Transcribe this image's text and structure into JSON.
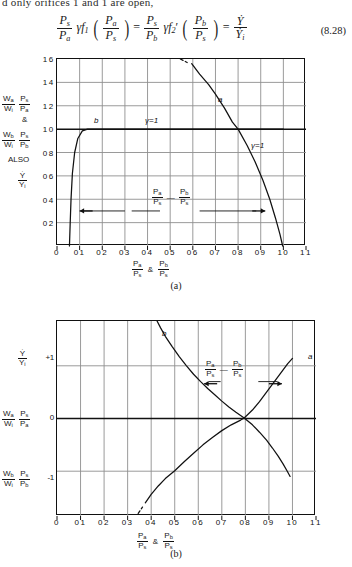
{
  "page": {
    "cut_text_line": "d only orifices 1 and 1 are open,",
    "equation_number": "(8.28)",
    "equation": {
      "lhs_frac_num": "P",
      "lhs_frac_num_sub": "s",
      "lhs_frac_den": "P",
      "lhs_frac_den_sub": "a",
      "gamma": "γ",
      "f1": "f",
      "f1_sub": "1",
      "arg1_num": "P",
      "arg1_num_sub": "a",
      "arg1_den": "P",
      "arg1_den_sub": "s",
      "eq1": "=",
      "mid_frac_num": "P",
      "mid_frac_num_sub": "s",
      "mid_frac_den": "P",
      "mid_frac_den_sub": "b",
      "f2": "f",
      "f2_sub": "2",
      "f2_prime": "′",
      "arg2_num": "P",
      "arg2_num_sub": "b",
      "arg2_den": "P",
      "arg2_den_sub": "s",
      "eq2": "=",
      "rhs_num": "Ẏ",
      "rhs_den": "Ẏ",
      "rhs_den_sub": "i"
    }
  },
  "chart_a": {
    "caption": "(a)",
    "x_axis_title_parts": {
      "left_num": "P",
      "left_num_sub": "a",
      "left_den": "P",
      "left_den_sub": "s",
      "amp": "&",
      "right_num": "P",
      "right_num_sub": "b",
      "right_den": "P",
      "right_den_sub": "s"
    },
    "y_side_labels": [
      {
        "id": "wa",
        "num": "W",
        "num_sub": "a",
        "den": "W",
        "den_sub": "i",
        "f2num": "P",
        "f2num_sub": "s",
        "f2den": "P",
        "f2den_sub": "a"
      },
      {
        "id": "amp",
        "text": "&"
      },
      {
        "id": "wb",
        "num": "W",
        "num_sub": "b",
        "den": "W",
        "den_sub": "i",
        "f2num": "P",
        "f2num_sub": "s",
        "f2den": "P",
        "f2den_sub": "b"
      },
      {
        "id": "also",
        "text": "ALSO"
      },
      {
        "id": "ydot",
        "num": "Ẏ",
        "den": "Ẏ",
        "den_sub": "i"
      }
    ],
    "inner_annotation": {
      "left_num": "P",
      "left_num_sub": "a",
      "left_den": "P",
      "left_den_sub": "s",
      "dash": "—",
      "right_num": "P",
      "right_num_sub": "b",
      "right_den": "P",
      "right_den_sub": "s"
    },
    "curve_labels": [
      {
        "text": "b",
        "x": 0.17,
        "y": 1.08
      },
      {
        "text": "a",
        "x": 0.67,
        "y": 1.4
      },
      {
        "text": "γ=1",
        "x": 0.36,
        "y": 1.08
      },
      {
        "text": "γ=1",
        "x": 0.755,
        "y": 0.92
      }
    ],
    "chart_data": {
      "type": "line",
      "title": "",
      "xlabel": "Pa/Ps & Pb/Ps",
      "ylabel": "Wa/Wi·Ps/Pa & Wb/Wi·Ps/Pb  ALSO  Ẏ/Ẏi",
      "xlim": [
        0,
        1.1
      ],
      "ylim": [
        0,
        1.6
      ],
      "xticks": [
        0,
        0.1,
        0.2,
        0.3,
        0.4,
        0.5,
        0.6,
        0.7,
        0.8,
        0.9,
        1.0,
        1.1
      ],
      "xticklabels": [
        "0",
        "0 1",
        "0 2",
        "0 3",
        "0 4",
        "0 5",
        "0 6",
        "0 7",
        "0 8",
        "0 9",
        "1 0",
        "1 1"
      ],
      "yticks": [
        0.2,
        0.4,
        0.6,
        0.8,
        1.0,
        1.2,
        1.4,
        1.6
      ],
      "yticklabels": [
        "0 2",
        "0 4",
        "0 6",
        "0 8",
        "1 0",
        "1 2",
        "1 4",
        "1 6"
      ],
      "grid": true,
      "legend": "none",
      "series": [
        {
          "name": "b",
          "style": "solid",
          "points": [
            [
              0.055,
              0.0
            ],
            [
              0.058,
              0.18
            ],
            [
              0.062,
              0.4
            ],
            [
              0.068,
              0.62
            ],
            [
              0.078,
              0.8
            ],
            [
              0.092,
              0.92
            ],
            [
              0.112,
              0.985
            ],
            [
              0.135,
              1.0
            ],
            [
              0.2,
              1.0
            ],
            [
              0.4,
              1.0
            ],
            [
              0.6,
              1.0
            ],
            [
              0.8,
              1.0
            ],
            [
              0.95,
              1.0
            ],
            [
              1.0,
              1.0
            ]
          ]
        },
        {
          "name": "a",
          "style": "solid",
          "points": [
            [
              0.595,
              1.56
            ],
            [
              0.63,
              1.47
            ],
            [
              0.67,
              1.38
            ],
            [
              0.7,
              1.3
            ],
            [
              0.74,
              1.18
            ],
            [
              0.775,
              1.06
            ],
            [
              0.8,
              1.0
            ],
            [
              0.84,
              0.86
            ],
            [
              0.875,
              0.72
            ],
            [
              0.91,
              0.56
            ],
            [
              0.94,
              0.4
            ],
            [
              0.965,
              0.24
            ],
            [
              0.985,
              0.1
            ],
            [
              0.997,
              0.0
            ]
          ]
        },
        {
          "name": "a-dashed-extension",
          "style": "dashed",
          "points": [
            [
              0.545,
              1.6
            ],
            [
              0.575,
              1.57
            ]
          ]
        }
      ],
      "annotations": [
        {
          "text": "Pa/Ps — Pb/Ps",
          "x": 0.5,
          "y": 0.3
        },
        {
          "text": "arrow-left",
          "x": 0.1,
          "y": 0.3
        },
        {
          "text": "arrow-right",
          "x": 0.92,
          "y": 0.3
        }
      ]
    }
  },
  "chart_b": {
    "caption": "(b)",
    "x_axis_title_parts": {
      "left_num": "P",
      "left_num_sub": "a",
      "left_den": "P",
      "left_den_sub": "s",
      "amp": "&",
      "right_num": "P",
      "right_num_sub": "b",
      "right_den": "P",
      "right_den_sub": "s"
    },
    "y_side_labels": [
      {
        "id": "ydot",
        "num": "Ẏ",
        "den": "Ẏ",
        "den_sub": "i",
        "tick": "+1"
      },
      {
        "id": "wa",
        "num": "W",
        "num_sub": "a",
        "den": "W",
        "den_sub": "i",
        "f2num": "P",
        "f2num_sub": "s",
        "f2den": "P",
        "f2den_sub": "a",
        "tick": "0"
      },
      {
        "id": "wb",
        "num": "W",
        "num_sub": "b",
        "den": "W",
        "den_sub": "i",
        "f2num": "P",
        "f2num_sub": "s",
        "f2den": "P",
        "f2den_sub": "b",
        "tick": "-1"
      }
    ],
    "inner_annotation": {
      "left_num": "P",
      "left_num_sub": "a",
      "left_den": "P",
      "left_den_sub": "s",
      "dash": "—",
      "right_num": "P",
      "right_num_sub": "b",
      "right_den": "P",
      "right_den_sub": "s"
    },
    "curve_labels": [
      {
        "text": "b",
        "x": 0.465,
        "y": 1.55
      },
      {
        "text": "a",
        "x": 1.005,
        "y": 1.1
      }
    ],
    "chart_data": {
      "type": "line",
      "title": "",
      "xlabel": "Pa/Ps & Pb/Ps",
      "ylabel": "Ẏ/Ẏi , Wa/Wi·Ps/Pa , Wb/Wi·Ps/Pb",
      "xlim": [
        0,
        1.1
      ],
      "ylim": [
        -1.85,
        1.85
      ],
      "xticks": [
        0,
        0.1,
        0.2,
        0.3,
        0.4,
        0.5,
        0.6,
        0.7,
        0.8,
        0.9,
        1.0,
        1.1
      ],
      "xticklabels": [
        "0",
        "0 1",
        "0 2",
        "0 3",
        "0 4",
        "0 5",
        "0 6",
        "0 7",
        "0 8",
        "0 9",
        "1 0",
        "1 1"
      ],
      "yticks": [
        1,
        0,
        -1
      ],
      "yticklabels": [
        "+1",
        "0",
        "-1"
      ],
      "grid": true,
      "legend": "none",
      "series": [
        {
          "name": "b",
          "style": "solid",
          "points": [
            [
              0.425,
              1.85
            ],
            [
              0.44,
              1.72
            ],
            [
              0.46,
              1.56
            ],
            [
              0.49,
              1.36
            ],
            [
              0.52,
              1.17
            ],
            [
              0.55,
              1.0
            ],
            [
              0.58,
              0.84
            ],
            [
              0.61,
              0.7
            ],
            [
              0.64,
              0.57
            ],
            [
              0.67,
              0.45
            ],
            [
              0.7,
              0.33
            ],
            [
              0.73,
              0.22
            ],
            [
              0.76,
              0.12
            ],
            [
              0.795,
              0.01
            ],
            [
              0.83,
              -0.12
            ],
            [
              0.86,
              -0.26
            ],
            [
              0.89,
              -0.41
            ],
            [
              0.915,
              -0.56
            ],
            [
              0.94,
              -0.72
            ],
            [
              0.96,
              -0.86
            ],
            [
              0.978,
              -1.0
            ],
            [
              0.99,
              -1.1
            ]
          ]
        },
        {
          "name": "a",
          "style": "solid",
          "points": [
            [
              0.375,
              -1.6
            ],
            [
              0.4,
              -1.44
            ],
            [
              0.43,
              -1.28
            ],
            [
              0.46,
              -1.14
            ],
            [
              0.5,
              -0.99
            ],
            [
              0.54,
              -0.82
            ],
            [
              0.58,
              -0.66
            ],
            [
              0.62,
              -0.5
            ],
            [
              0.66,
              -0.36
            ],
            [
              0.7,
              -0.23
            ],
            [
              0.74,
              -0.12
            ],
            [
              0.78,
              -0.03
            ],
            [
              0.795,
              0.01
            ],
            [
              0.83,
              0.16
            ],
            [
              0.86,
              0.32
            ],
            [
              0.89,
              0.5
            ],
            [
              0.92,
              0.68
            ],
            [
              0.95,
              0.86
            ],
            [
              0.98,
              1.04
            ],
            [
              1.0,
              1.14
            ]
          ]
        },
        {
          "name": "a-dashed-extension",
          "style": "dashed",
          "points": [
            [
              0.345,
              -1.8
            ],
            [
              0.363,
              -1.68
            ]
          ]
        }
      ],
      "annotations": [
        {
          "text": "Pa/Ps — Pb/Ps",
          "x": 0.735,
          "y": 0.7
        },
        {
          "text": "arrow-left",
          "x": 0.625,
          "y": 0.66
        },
        {
          "text": "arrow-right",
          "x": 0.955,
          "y": 0.66
        }
      ]
    }
  }
}
